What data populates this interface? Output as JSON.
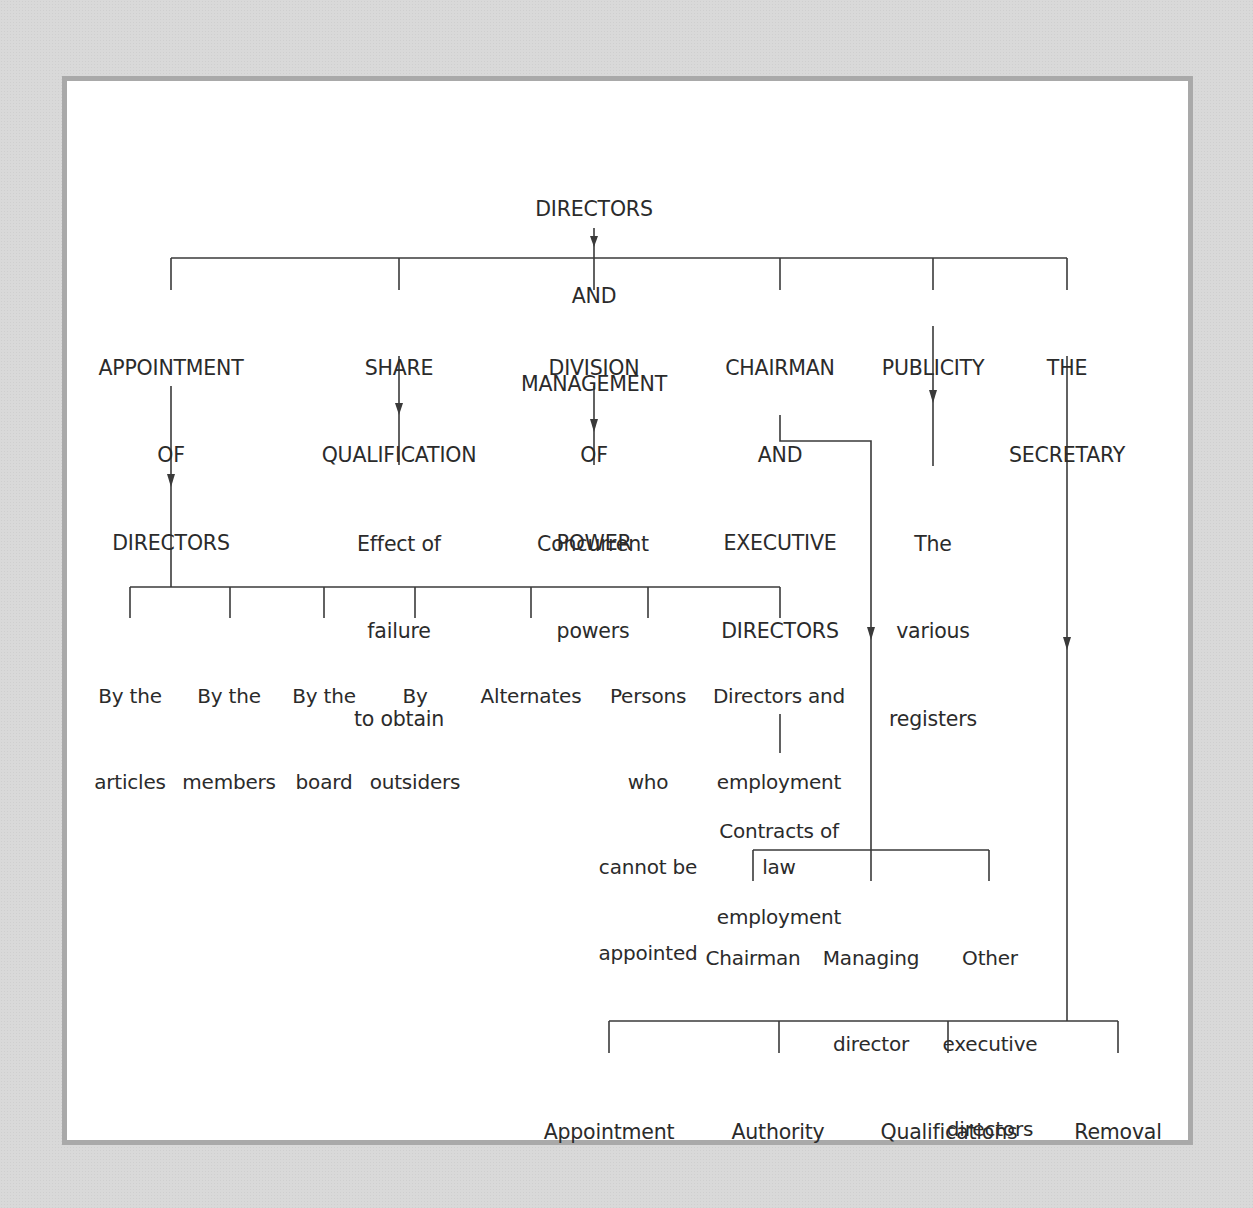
{
  "diagram": {
    "root": {
      "lines": [
        "DIRECTORS",
        "AND",
        "MANAGEMENT"
      ]
    },
    "branches": [
      {
        "id": "appointment",
        "lines": [
          "APPOINTMENT",
          "OF",
          "DIRECTORS"
        ],
        "children": [
          {
            "lines": [
              "By the",
              "articles"
            ]
          },
          {
            "lines": [
              "By the",
              "members"
            ]
          },
          {
            "lines": [
              "By the",
              "board"
            ]
          },
          {
            "lines": [
              "By",
              "outsiders"
            ]
          },
          {
            "lines": [
              "Alternates"
            ]
          },
          {
            "lines": [
              "Persons",
              "who",
              "cannot be",
              "appointed"
            ]
          },
          {
            "lines": [
              "Directors and",
              "employment",
              "law"
            ],
            "children": [
              {
                "lines": [
                  "Contracts of",
                  "employment"
                ]
              }
            ]
          }
        ]
      },
      {
        "id": "share",
        "lines": [
          "SHARE",
          "QUALIFICATION"
        ],
        "children": [
          {
            "lines": [
              "Effect of",
              "failure",
              "to obtain"
            ]
          }
        ]
      },
      {
        "id": "division",
        "lines": [
          "DIVISION",
          "OF",
          "POWER"
        ],
        "children": [
          {
            "lines": [
              "Concurrent",
              "powers"
            ]
          }
        ]
      },
      {
        "id": "chairman",
        "lines": [
          "CHAIRMAN",
          "AND",
          "EXECUTIVE",
          "DIRECTORS"
        ],
        "children": [
          {
            "lines": [
              "Chairman"
            ]
          },
          {
            "lines": [
              "Managing",
              "director"
            ]
          },
          {
            "lines": [
              "Other",
              "executive",
              "directors"
            ]
          }
        ]
      },
      {
        "id": "publicity",
        "lines": [
          "PUBLICITY"
        ],
        "children": [
          {
            "lines": [
              "The",
              "various",
              "registers"
            ]
          }
        ]
      },
      {
        "id": "secretary",
        "lines": [
          "THE",
          "SECRETARY"
        ],
        "children": [
          {
            "lines": [
              "Appointment"
            ]
          },
          {
            "lines": [
              "Authority"
            ]
          },
          {
            "lines": [
              "Qualifications"
            ]
          },
          {
            "lines": [
              "Removal"
            ]
          }
        ]
      }
    ]
  },
  "colors": {
    "page_background": "#d9d9d9",
    "frame_border": "#a9a9a9",
    "frame_fill": "#ffffff",
    "text": "#2b2b2b",
    "lines": "#3a3a3a"
  }
}
